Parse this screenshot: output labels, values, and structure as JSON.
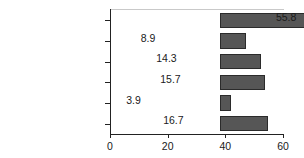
{
  "chart_data": {
    "type": "bar",
    "orientation": "horizontal",
    "title": "",
    "xlabel": "",
    "ylabel": "",
    "categories": [
      "Employment-based",
      "Direct-purchase",
      "Medicare",
      "Medicaid",
      "Military",
      "Not covered"
    ],
    "values": [
      55.8,
      8.9,
      14.3,
      15.7,
      3.9,
      16.7
    ],
    "value_labels": [
      "55.8",
      "8.9",
      "14.3",
      "15.7",
      "3.9",
      "16.7"
    ],
    "xlim": [
      0,
      60
    ],
    "xticks": [
      0,
      20,
      40,
      60
    ],
    "xtick_labels": [
      "0",
      "20",
      "40",
      "60"
    ],
    "grid": false,
    "legend": false,
    "bar_color": "#565656",
    "bar_edge_color": "#2b2b2b",
    "axis_color": "#222222",
    "text_color": "#1a1a1a",
    "background": "#ffffff"
  }
}
